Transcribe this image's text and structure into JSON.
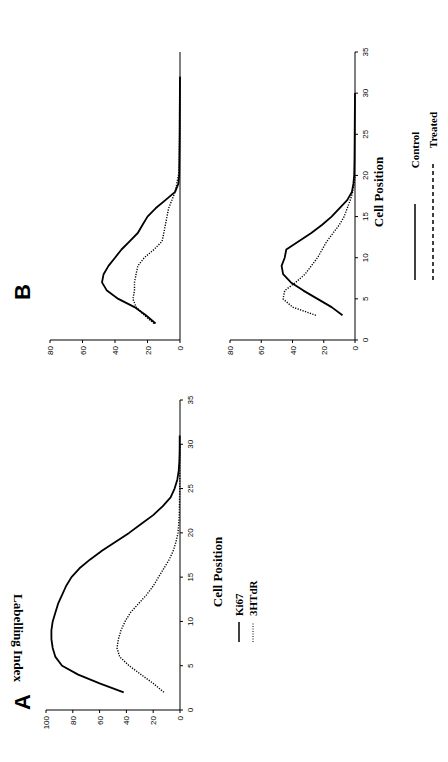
{
  "figure": {
    "orientation": "rotated-90-ccw"
  },
  "chart_data": [
    {
      "panel": "A",
      "type": "line",
      "title": "",
      "xlabel": "Cell Position",
      "ylabel": "Labelling Index",
      "xlim": [
        0,
        35
      ],
      "ylim": [
        0,
        100
      ],
      "xticks": [
        0,
        5,
        10,
        15,
        20,
        25,
        30,
        35
      ],
      "yticks": [
        0,
        20,
        40,
        60,
        80,
        100
      ],
      "grid": false,
      "legend_position": "right-below",
      "series": [
        {
          "name": "Ki67",
          "style": "solid",
          "x": [
            2,
            3,
            4,
            5,
            6,
            7,
            8,
            9,
            10,
            11,
            12,
            13,
            14,
            15,
            16,
            17,
            18,
            19,
            20,
            21,
            22,
            23,
            24,
            25,
            26,
            27,
            28,
            29,
            30,
            31
          ],
          "values": [
            42,
            60,
            76,
            88,
            93,
            95,
            96,
            96,
            95,
            93,
            91,
            88,
            85,
            81,
            75,
            67,
            58,
            48,
            38,
            29,
            20,
            13,
            7,
            4,
            2,
            1,
            0.5,
            0.3,
            0.2,
            0.2
          ]
        },
        {
          "name": "3HTdR",
          "style": "dotted",
          "x": [
            2,
            3,
            4,
            5,
            6,
            7,
            8,
            9,
            10,
            11,
            12,
            13,
            14,
            15,
            16,
            17,
            18,
            19,
            20,
            21,
            22,
            25,
            30
          ],
          "values": [
            12,
            20,
            29,
            38,
            45,
            47,
            46,
            44,
            41,
            37,
            31,
            25,
            20,
            16,
            12,
            8,
            5,
            3,
            1.5,
            1,
            0.5,
            0.2,
            0
          ]
        }
      ]
    },
    {
      "panel": "B-top",
      "type": "line",
      "xlabel": "",
      "ylabel": "",
      "xlim": [
        0,
        35
      ],
      "ylim": [
        0,
        80
      ],
      "yticks": [
        0,
        20,
        40,
        60,
        80
      ],
      "grid": false,
      "series": [
        {
          "name": "Control",
          "style": "solid",
          "x": [
            2,
            3,
            4,
            5,
            6,
            7,
            8,
            9,
            10,
            11,
            12,
            13,
            14,
            15,
            16,
            17,
            18,
            19,
            20,
            25,
            32
          ],
          "values": [
            15,
            21,
            28,
            38,
            45,
            48,
            47,
            44,
            40,
            36,
            31,
            26,
            23,
            20,
            15,
            9,
            3,
            1,
            0.5,
            0.2,
            0
          ]
        },
        {
          "name": "Treated",
          "style": "dotted",
          "x": [
            2,
            3,
            4,
            5,
            6,
            7,
            8,
            9,
            10,
            11,
            12,
            13,
            14,
            15,
            16,
            17,
            18,
            19,
            20,
            21,
            25,
            32
          ],
          "values": [
            16,
            22,
            27,
            29,
            28,
            28,
            27,
            26,
            22,
            16,
            11,
            10,
            9,
            8,
            7,
            5,
            3,
            2,
            1,
            0.5,
            0.3,
            0.2
          ]
        }
      ]
    },
    {
      "panel": "B-bottom",
      "type": "line",
      "xlabel": "Cell Position",
      "ylabel": "",
      "xlim": [
        0,
        35
      ],
      "ylim": [
        0,
        80
      ],
      "xticks": [
        0,
        5,
        10,
        15,
        20,
        25,
        30,
        35
      ],
      "yticks": [
        0,
        20,
        40,
        60,
        80
      ],
      "grid": false,
      "legend_position": "right-below",
      "series": [
        {
          "name": "Control",
          "style": "solid",
          "x": [
            3,
            4,
            5,
            6,
            7,
            8,
            9,
            10,
            11,
            12,
            13,
            14,
            15,
            16,
            17,
            18,
            19,
            20,
            22,
            25,
            30
          ],
          "values": [
            8,
            15,
            24,
            33,
            41,
            46,
            47,
            45,
            44,
            36,
            28,
            21,
            15,
            10,
            5,
            2,
            1,
            0.5,
            0.3,
            0.2,
            0
          ]
        },
        {
          "name": "Treated",
          "style": "dotted",
          "x": [
            3,
            4,
            5,
            6,
            7,
            8,
            9,
            10,
            11,
            12,
            13,
            14,
            15,
            16,
            17,
            18,
            19,
            20
          ],
          "values": [
            25,
            40,
            46,
            45,
            38,
            32,
            28,
            24,
            21,
            18,
            14,
            10,
            7,
            5,
            3,
            1.5,
            0.5,
            0
          ]
        }
      ]
    }
  ],
  "labels": {
    "panel_a": "A",
    "panel_b": "B",
    "a_xlabel": "Cell Position",
    "a_ylabel": "Labelling Index",
    "b_xlabel": "Cell Position",
    "legend_a": [
      "Ki67",
      "3HTdR"
    ],
    "legend_b": [
      "Control",
      "Treated"
    ]
  }
}
